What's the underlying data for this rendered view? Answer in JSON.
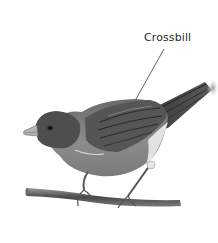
{
  "diagram": {
    "labels": [
      {
        "text": "Crossbill",
        "points_to": "bird-back"
      }
    ]
  },
  "colors": {
    "background": "#ffffff",
    "ink": "#2b2b2b",
    "body_mid": "#8a8a8a",
    "body_dark": "#4a4a4a",
    "belly_light": "#d6d6d6"
  }
}
